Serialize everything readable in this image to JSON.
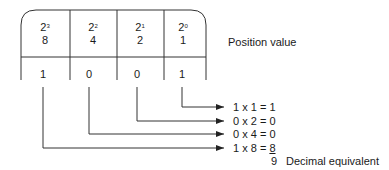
{
  "diagram": {
    "columns": [
      {
        "base": "2",
        "exp": "3",
        "value": "8",
        "bit": "1"
      },
      {
        "base": "2",
        "exp": "2",
        "value": "4",
        "bit": "0"
      },
      {
        "base": "2",
        "exp": "1",
        "value": "2",
        "bit": "0"
      },
      {
        "base": "2",
        "exp": "0",
        "value": "1",
        "bit": "1"
      }
    ],
    "position_label": "Position value",
    "equations": [
      {
        "lhs": "1 x 1 = ",
        "result": "1"
      },
      {
        "lhs": "0 x 2 = ",
        "result": "0"
      },
      {
        "lhs": "0 x 4 = ",
        "result": "0"
      },
      {
        "lhs": "1 x 8 = ",
        "result": "8"
      }
    ],
    "sum": "9",
    "sum_label": "Decimal equivalent",
    "line_color": "#333333"
  }
}
